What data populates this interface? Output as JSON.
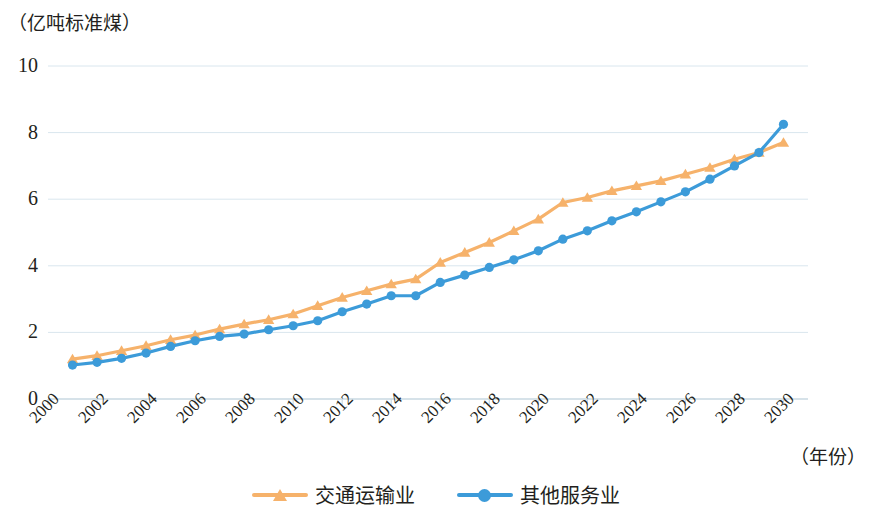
{
  "chart_data": {
    "type": "line",
    "title": "",
    "unit_label": "（亿吨标准煤）",
    "xlabel": "（年份）",
    "ylabel": "",
    "ylim": [
      0,
      10
    ],
    "yticks": [
      0,
      2,
      4,
      6,
      8,
      10
    ],
    "xlim": [
      2000,
      2031
    ],
    "xticks": [
      2000,
      2002,
      2004,
      2006,
      2008,
      2010,
      2012,
      2014,
      2016,
      2018,
      2020,
      2022,
      2024,
      2026,
      2028,
      2030
    ],
    "grid": true,
    "legend_position": "bottom",
    "x": [
      2001,
      2002,
      2003,
      2004,
      2005,
      2006,
      2007,
      2008,
      2009,
      2010,
      2011,
      2012,
      2013,
      2014,
      2015,
      2016,
      2017,
      2018,
      2019,
      2020,
      2021,
      2022,
      2023,
      2024,
      2025,
      2026,
      2027,
      2028,
      2029,
      2030
    ],
    "series": [
      {
        "name": "交通运输业",
        "color": "#F6B26B",
        "marker": "triangle",
        "values": [
          1.2,
          1.3,
          1.45,
          1.6,
          1.78,
          1.92,
          2.1,
          2.25,
          2.38,
          2.55,
          2.8,
          3.05,
          3.25,
          3.45,
          3.6,
          4.1,
          4.4,
          4.7,
          5.05,
          5.4,
          5.9,
          6.05,
          6.25,
          6.4,
          6.55,
          6.75,
          6.95,
          7.2,
          7.4,
          7.7
        ]
      },
      {
        "name": "其他服务业",
        "color": "#3C9BD9",
        "marker": "circle",
        "values": [
          1.02,
          1.1,
          1.22,
          1.38,
          1.58,
          1.75,
          1.88,
          1.95,
          2.08,
          2.2,
          2.35,
          2.62,
          2.85,
          3.1,
          3.1,
          3.5,
          3.72,
          3.95,
          4.18,
          4.45,
          4.8,
          5.05,
          5.35,
          5.62,
          5.92,
          6.22,
          6.6,
          7.0,
          7.4,
          8.25
        ]
      }
    ]
  },
  "layout": {
    "plot_left": 48,
    "plot_right": 808,
    "plot_top": 66,
    "plot_bottom": 399,
    "grid_color": "#d9e6ee",
    "axis_color": "#c9d8e2",
    "text_color": "#231f20"
  }
}
